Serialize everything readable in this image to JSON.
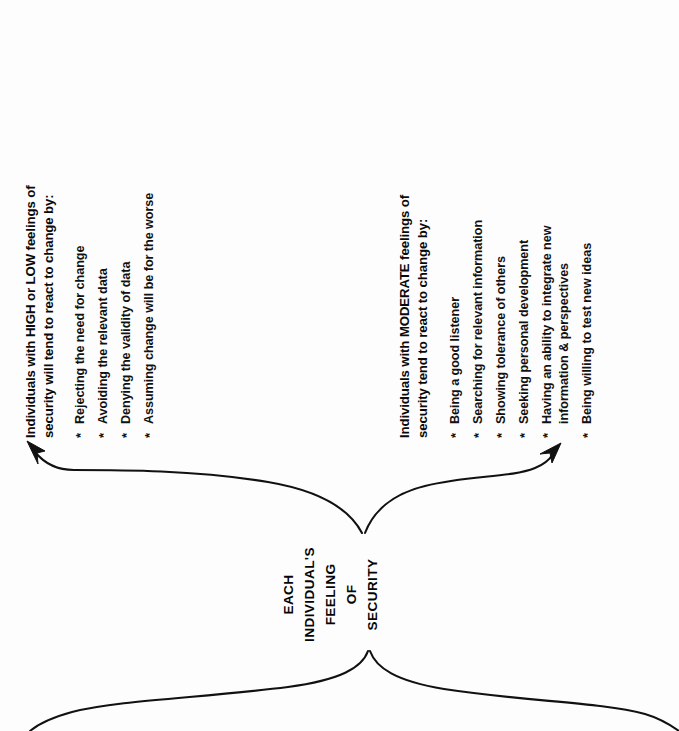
{
  "diagram": {
    "title": "Each Individual's Feeling of Security",
    "orientation": "rotated-90-ccw",
    "ink_color": "#111111",
    "background_color": "#fdfdfd",
    "center_node": {
      "lines": [
        "EACH",
        "INDIVIDUAL'S",
        "FEELING",
        "OF",
        "SECURITY"
      ]
    },
    "branches": [
      {
        "id": "high-low",
        "heading_lines": [
          "Individuals with HIGH or LOW feelings of",
          "security will tend to react to change by:"
        ],
        "bullet_marker": "*",
        "bullets": [
          {
            "lines": [
              "Rejecting the need for change"
            ]
          },
          {
            "lines": [
              "Avoiding the relevant data"
            ]
          },
          {
            "lines": [
              "Denying the validity of data"
            ]
          },
          {
            "lines": [
              "Assuming change will be for the worse"
            ]
          }
        ]
      },
      {
        "id": "moderate",
        "heading_lines": [
          "Individuals with MODERATE feelings of",
          "security tend to react to change by:"
        ],
        "bullet_marker": "*",
        "bullets": [
          {
            "lines": [
              "Being a good listener"
            ]
          },
          {
            "lines": [
              "Searching for relevant information"
            ]
          },
          {
            "lines": [
              "Showing tolerance of others"
            ]
          },
          {
            "lines": [
              "Seeking personal development"
            ]
          },
          {
            "lines": [
              "Having an ability to integrate new",
              "information & perspectives"
            ]
          },
          {
            "lines": [
              "Being willing to test new ideas"
            ]
          }
        ]
      }
    ],
    "connectors": [
      {
        "id": "arrow-to-high-low",
        "kind": "curved-arrow",
        "direction": "up-left"
      },
      {
        "id": "arrow-to-moderate",
        "kind": "curved-arrow",
        "direction": "up-right"
      },
      {
        "id": "inflow-left",
        "kind": "curve",
        "direction": "down-left"
      },
      {
        "id": "inflow-right",
        "kind": "curve",
        "direction": "down-right"
      }
    ]
  }
}
